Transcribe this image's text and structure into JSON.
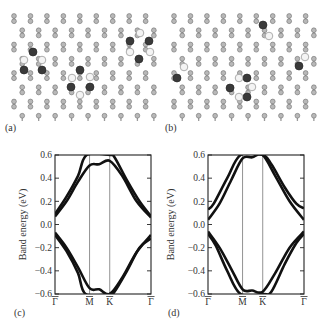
{
  "figure": {
    "panels": [
      {
        "id": "a",
        "label": "(a)",
        "type": "atomic-structure",
        "description": "Graphene lattice with hydrogen adatoms (dark) and adsorbed H atoms (light crescents)"
      },
      {
        "id": "b",
        "label": "(b)",
        "type": "atomic-structure",
        "description": "Graphene lattice with alternate hydrogen adsorption configuration"
      },
      {
        "id": "c",
        "label": "(c)",
        "type": "band-structure"
      },
      {
        "id": "d",
        "label": "(d)",
        "type": "band-structure"
      }
    ]
  },
  "labels": {
    "a": "(a)",
    "b": "(b)",
    "c": "(c)",
    "d": "(d)",
    "ylabel": "Band energy (eV)",
    "yticks": [
      "0.6",
      "0.4",
      "0.2",
      "0.0",
      "−0.2",
      "−0.4",
      "−0.6"
    ],
    "xticks": [
      "Γ̄",
      "M̄",
      "K̄",
      "Γ̄"
    ]
  },
  "chart_data": [
    {
      "type": "line",
      "title": "(c)",
      "xlabel": "",
      "ylabel": "Band energy (eV)",
      "ylim": [
        -0.6,
        0.6
      ],
      "x_ticks": [
        "Γ",
        "M",
        "K",
        "Γ"
      ],
      "x_tick_positions": [
        0.0,
        0.36,
        0.57,
        1.0
      ],
      "y_ticks": [
        0.6,
        0.4,
        0.2,
        0.0,
        -0.2,
        -0.4,
        -0.6
      ],
      "grid": false,
      "series": [
        {
          "name": "conduction band 1",
          "x": [
            0.0,
            0.12,
            0.24,
            0.36,
            0.46,
            0.57,
            0.7,
            0.85,
            1.0
          ],
          "y": [
            0.07,
            0.2,
            0.37,
            0.51,
            0.52,
            0.55,
            0.42,
            0.2,
            0.06
          ]
        },
        {
          "name": "conduction band 2",
          "x": [
            0.0,
            0.12,
            0.24,
            0.33,
            0.57,
            0.62,
            0.75,
            0.88,
            1.0
          ],
          "y": [
            0.09,
            0.24,
            0.42,
            0.6,
            0.6,
            0.58,
            0.38,
            0.2,
            0.07
          ]
        },
        {
          "name": "valence band 1",
          "x": [
            0.0,
            0.12,
            0.24,
            0.36,
            0.46,
            0.57,
            0.7,
            0.85,
            1.0
          ],
          "y": [
            -0.07,
            -0.2,
            -0.37,
            -0.55,
            -0.56,
            -0.6,
            -0.46,
            -0.24,
            -0.09
          ]
        },
        {
          "name": "valence band 2",
          "x": [
            0.0,
            0.12,
            0.24,
            0.32,
            0.57,
            0.62,
            0.75,
            0.88,
            1.0
          ],
          "y": [
            -0.09,
            -0.23,
            -0.42,
            -0.6,
            -0.6,
            -0.58,
            -0.4,
            -0.2,
            -0.12
          ]
        }
      ]
    },
    {
      "type": "line",
      "title": "(d)",
      "xlabel": "",
      "ylabel": "Band energy (eV)",
      "ylim": [
        -0.6,
        0.6
      ],
      "x_ticks": [
        "Γ",
        "M",
        "K",
        "Γ"
      ],
      "x_tick_positions": [
        0.0,
        0.36,
        0.57,
        1.0
      ],
      "y_ticks": [
        0.6,
        0.4,
        0.2,
        0.0,
        -0.2,
        -0.4,
        -0.6
      ],
      "grid": false,
      "series": [
        {
          "name": "conduction band 1",
          "x": [
            0.0,
            0.12,
            0.24,
            0.36,
            0.46,
            0.57,
            0.7,
            0.85,
            1.0
          ],
          "y": [
            0.04,
            0.18,
            0.38,
            0.57,
            0.58,
            0.6,
            0.42,
            0.2,
            0.04
          ]
        },
        {
          "name": "conduction band 2",
          "x": [
            0.0,
            0.06,
            0.2,
            0.34,
            0.57,
            0.66,
            0.8,
            0.92,
            1.0
          ],
          "y": [
            0.13,
            0.18,
            0.4,
            0.6,
            0.6,
            0.52,
            0.32,
            0.18,
            0.14
          ]
        },
        {
          "name": "valence band 1",
          "x": [
            0.0,
            0.12,
            0.24,
            0.36,
            0.46,
            0.57,
            0.7,
            0.85,
            1.0
          ],
          "y": [
            -0.06,
            -0.2,
            -0.38,
            -0.56,
            -0.57,
            -0.58,
            -0.42,
            -0.2,
            -0.06
          ]
        },
        {
          "name": "valence band 2",
          "x": [
            0.0,
            0.08,
            0.2,
            0.34,
            0.57,
            0.66,
            0.8,
            0.92,
            1.0
          ],
          "y": [
            -0.08,
            -0.18,
            -0.4,
            -0.6,
            -0.6,
            -0.58,
            -0.34,
            -0.16,
            -0.08
          ]
        }
      ]
    }
  ]
}
